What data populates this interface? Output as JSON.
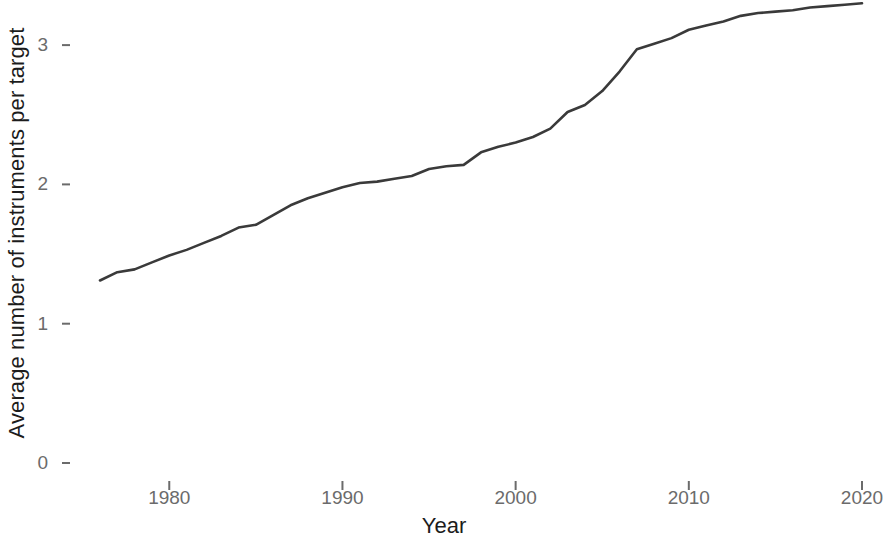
{
  "chart_data": {
    "type": "line",
    "title": "",
    "subtitle": "",
    "xlabel": "Year",
    "ylabel": "Average number of instruments per target",
    "xlim": [
      1975.5,
      2020.5
    ],
    "ylim": [
      0,
      3.45
    ],
    "grid": false,
    "legend": null,
    "legend_position": "none",
    "x_ticks": [
      1980,
      1990,
      2000,
      2010,
      2020
    ],
    "x_tick_labels": [
      "1980",
      "1990",
      "2000",
      "2010",
      "2020"
    ],
    "y_ticks": [
      0,
      1,
      2,
      3
    ],
    "y_tick_labels": [
      "0",
      "1",
      "2",
      "3"
    ],
    "line_color": "#3a3a3a",
    "line_width": 2.6,
    "series": [
      {
        "name": "Average number of instruments per target",
        "x": [
          1976,
          1977,
          1978,
          1979,
          1980,
          1981,
          1982,
          1983,
          1984,
          1985,
          1986,
          1987,
          1988,
          1989,
          1990,
          1991,
          1992,
          1993,
          1994,
          1995,
          1996,
          1997,
          1998,
          1999,
          2000,
          2001,
          2002,
          2003,
          2004,
          2005,
          2006,
          2007,
          2008,
          2009,
          2010,
          2011,
          2012,
          2013,
          2014,
          2015,
          2016,
          2017,
          2018,
          2019,
          2020
        ],
        "values": [
          1.31,
          1.37,
          1.39,
          1.44,
          1.49,
          1.53,
          1.58,
          1.63,
          1.69,
          1.71,
          1.78,
          1.85,
          1.9,
          1.94,
          1.98,
          2.01,
          2.02,
          2.04,
          2.06,
          2.11,
          2.13,
          2.14,
          2.23,
          2.27,
          2.3,
          2.34,
          2.4,
          2.52,
          2.57,
          2.67,
          2.81,
          2.97,
          3.01,
          3.05,
          3.11,
          3.14,
          3.17,
          3.21,
          3.23,
          3.24,
          3.25,
          3.27,
          3.28,
          3.29,
          3.3
        ]
      }
    ]
  },
  "axes": {
    "x_title": "Year",
    "y_title": "Average number of instruments per target"
  }
}
